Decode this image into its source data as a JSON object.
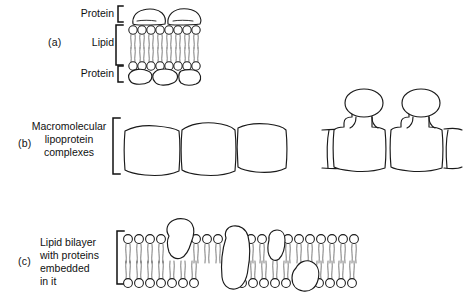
{
  "figure": {
    "background_color": "#ffffff",
    "ink_color": "#1a1a1a"
  },
  "panels": [
    {
      "id": "a",
      "letter": "(a)",
      "model_name": "Unit membrane / protein-lipid-protein sandwich",
      "labels": [
        {
          "id": "protein-top",
          "text": "Protein",
          "align": "right"
        },
        {
          "id": "lipid",
          "text": "Lipid",
          "align": "right"
        },
        {
          "id": "protein-bottom",
          "text": "Protein",
          "align": "right"
        }
      ],
      "brackets": 3,
      "structure": {
        "lipid_head_count_per_leaflet": 8,
        "top_protein_shapes": 2,
        "bottom_protein_shapes": 3,
        "bilayer": true
      }
    },
    {
      "id": "b",
      "letter": "(b)",
      "model_name": "Macromolecular lipoprotein subunit model",
      "labels": [
        {
          "id": "line-1",
          "text": "Macromolecular",
          "align": "center"
        },
        {
          "id": "line-2",
          "text": "lipoprotein",
          "align": "center"
        },
        {
          "id": "line-3",
          "text": "complexes",
          "align": "center"
        }
      ],
      "brackets": 1,
      "structure": {
        "left_group_subunits": 3,
        "right_group_subunits": 2,
        "right_group_has_stalked_heads": true
      }
    },
    {
      "id": "c",
      "letter": "(c)",
      "model_name": "Fluid mosaic model",
      "labels": [
        {
          "id": "line-1",
          "text": "Lipid bilayer",
          "align": "left"
        },
        {
          "id": "line-2",
          "text": "with proteins",
          "align": "left"
        },
        {
          "id": "line-3",
          "text": "embedded",
          "align": "left"
        },
        {
          "id": "line-4",
          "text": "in it",
          "align": "left"
        }
      ],
      "brackets": 1,
      "structure": {
        "lipid_head_count_per_leaflet": 17,
        "embedded_proteins": 4,
        "peripheral_proteins": 1,
        "bilayer": true
      }
    }
  ]
}
